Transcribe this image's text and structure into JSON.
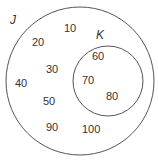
{
  "diagram": {
    "type": "venn",
    "sets": [
      {
        "name": "J",
        "elements_only": [
          "10",
          "20",
          "30",
          "40",
          "50",
          "90",
          "100"
        ]
      },
      {
        "name": "K",
        "subset_of": "J",
        "elements": [
          "60",
          "70",
          "80"
        ]
      }
    ],
    "labels": {
      "J": "J",
      "K": "K",
      "e10": "10",
      "e20": "20",
      "e30": "30",
      "e40": "40",
      "e50": "50",
      "e60": "60",
      "e70": "70",
      "e80": "80",
      "e90": "90",
      "e100": "100"
    },
    "colors": {
      "stroke": "#555555",
      "text": "#333333"
    }
  }
}
